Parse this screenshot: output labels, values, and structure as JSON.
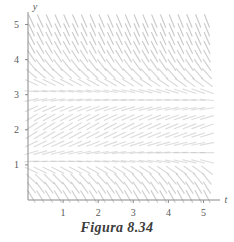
{
  "figure": {
    "caption": "Figura 8.34",
    "axis_color": "#8a8a8a",
    "field_color": "#b4b4b4",
    "tick_label_color": "#5a5a5a",
    "background": "#ffffff"
  },
  "chart_data": {
    "type": "scatter",
    "title": "Figura 8.34",
    "subtitle": "",
    "xlabel": "t",
    "ylabel": "y",
    "xlim": [
      0,
      5.3
    ],
    "ylim": [
      0,
      5.3
    ],
    "xticks": [
      1,
      2,
      3,
      4,
      5
    ],
    "yticks": [
      1,
      2,
      3,
      4,
      5
    ],
    "xtick_labels": [
      "1",
      "2",
      "3",
      "4",
      "5"
    ],
    "ytick_labels": [
      "1",
      "2",
      "3",
      "4",
      "5"
    ],
    "grid": false,
    "legend": null,
    "plot_kind": "slope-field",
    "field": {
      "x_samples": [
        0.1,
        0.35,
        0.6,
        0.85,
        1.1,
        1.35,
        1.6,
        1.85,
        2.1,
        2.35,
        2.6,
        2.85,
        3.1,
        3.35,
        3.6,
        3.85,
        4.1,
        4.35,
        4.6,
        4.85,
        5.1
      ],
      "y_samples": [
        0.1,
        0.35,
        0.6,
        0.85,
        1.1,
        1.35,
        1.6,
        1.85,
        2.1,
        2.35,
        2.6,
        2.85,
        3.1,
        3.35,
        3.6,
        3.85,
        4.1,
        4.35,
        4.6,
        4.85,
        5.1
      ],
      "slope_by_y": [
        {
          "y": 0.1,
          "slope": -1.6
        },
        {
          "y": 0.35,
          "slope": -1.3
        },
        {
          "y": 0.6,
          "slope": -0.95
        },
        {
          "y": 0.85,
          "slope": -0.45
        },
        {
          "y": 1.1,
          "slope": 0.05
        },
        {
          "y": 1.35,
          "slope": 0.3
        },
        {
          "y": 1.6,
          "slope": 0.5
        },
        {
          "y": 1.85,
          "slope": 0.62
        },
        {
          "y": 2.1,
          "slope": 0.66
        },
        {
          "y": 2.35,
          "slope": 0.6
        },
        {
          "y": 2.6,
          "slope": 0.46
        },
        {
          "y": 2.85,
          "slope": 0.22
        },
        {
          "y": 3.1,
          "slope": -0.05
        },
        {
          "y": 3.35,
          "slope": -0.45
        },
        {
          "y": 3.6,
          "slope": -0.85
        },
        {
          "y": 3.85,
          "slope": -1.2
        },
        {
          "y": 4.1,
          "slope": -1.5
        },
        {
          "y": 4.35,
          "slope": -1.75
        },
        {
          "y": 4.6,
          "slope": -1.95
        },
        {
          "y": 4.85,
          "slope": -2.1
        },
        {
          "y": 5.1,
          "slope": -2.2
        }
      ],
      "x_tilt": -0.06,
      "segment_length": 0.19
    }
  }
}
